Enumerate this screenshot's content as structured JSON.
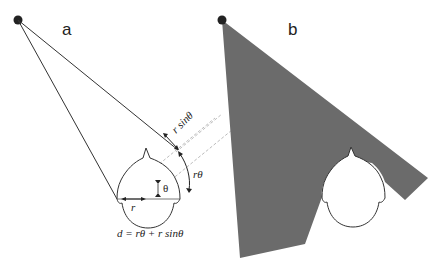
{
  "panels": [
    {
      "label": "a",
      "annotations": {
        "r_sin_theta": "r sinθ",
        "r_theta": "rθ",
        "theta": "θ",
        "r": "r"
      },
      "formula": "d = rθ + r sinθ"
    },
    {
      "label": "b"
    }
  ],
  "colors": {
    "line": "#333333",
    "dashed": "#aaaaaa",
    "shadow_fill": "#6b6b6b",
    "dot": "#222222",
    "head_fill": "#ffffff"
  }
}
